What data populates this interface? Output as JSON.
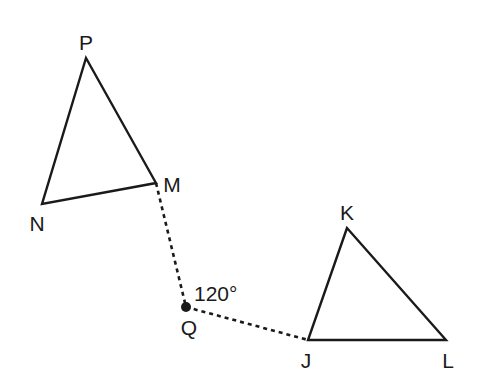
{
  "diagram": {
    "stroke_color": "#1a1a1a",
    "triangles": [
      {
        "name": "PMN",
        "vertices": {
          "P": {
            "x": 86,
            "y": 58,
            "label": "P",
            "label_x": 86,
            "label_y": 50
          },
          "M": {
            "x": 156,
            "y": 183,
            "label": "M",
            "label_x": 172,
            "label_y": 192
          },
          "N": {
            "x": 42,
            "y": 204,
            "label": "N",
            "label_x": 37,
            "label_y": 231
          }
        }
      },
      {
        "name": "KJL",
        "vertices": {
          "K": {
            "x": 347,
            "y": 228,
            "label": "K",
            "label_x": 347,
            "label_y": 220
          },
          "J": {
            "x": 308,
            "y": 340,
            "label": "J",
            "label_x": 306,
            "label_y": 368
          },
          "L": {
            "x": 446,
            "y": 340,
            "label": "L",
            "label_x": 448,
            "label_y": 368
          }
        }
      }
    ],
    "center": {
      "name": "Q",
      "x": 186,
      "y": 307,
      "label": "Q",
      "label_x": 189,
      "label_y": 335
    },
    "angle": {
      "label": "120°",
      "x": 194,
      "y": 301
    },
    "dashed_segments": [
      {
        "from": "M",
        "to": "Q"
      },
      {
        "from": "Q",
        "to": "J"
      }
    ]
  }
}
